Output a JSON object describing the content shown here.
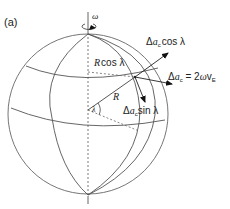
{
  "figure": {
    "panel_label": "(a)",
    "colors": {
      "background": "#ffffff",
      "line": "#555555",
      "text": "#222222",
      "arrow": "#111111"
    }
  },
  "labels": {
    "omega": "ω",
    "r_cos_lambda_R": "R",
    "r_cos_lambda_rest": "cos λ",
    "radius": "R",
    "lambda": "λ",
    "dac_cos_delta": "Δ",
    "dac_cos_a": "a",
    "dac_cos_sub": "c",
    "dac_cos_rest": "cos λ",
    "dac_eq_delta": "Δ",
    "dac_eq_a": "a",
    "dac_eq_sub": "c",
    "dac_eq_mid": " = 2",
    "dac_eq_omega": "ω",
    "dac_eq_v": "v",
    "dac_eq_vsub": "E",
    "dac_sin_delta": "Δ",
    "dac_sin_a": "a",
    "dac_sin_sub": "c",
    "dac_sin_rest": "sin λ"
  },
  "vectors": [
    {
      "name": "delta-a-c-cos-lambda",
      "label": "Δa_c cos λ"
    },
    {
      "name": "delta-a-c",
      "label": "Δa_c = 2ωv_E"
    },
    {
      "name": "delta-a-c-sin-lambda",
      "label": "Δa_c sin λ"
    }
  ]
}
